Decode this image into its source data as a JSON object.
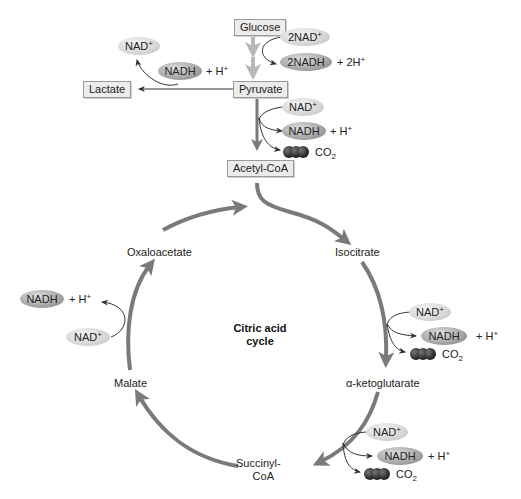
{
  "glycolysis": {
    "glucose": "Glucose",
    "pyruvate": "Pyruvate",
    "lactate": "Lactate",
    "acetyl_coa": "Acetyl-CoA",
    "nad_2": "2NAD",
    "nadh_2": "2NADH",
    "h_2": "+ 2H",
    "plus": "+"
  },
  "lactate_branch": {
    "nad": "NAD",
    "nadh": "NADH",
    "h": "+ H",
    "plus": "+"
  },
  "pyruvate_branch": {
    "nad": "NAD",
    "nadh": "NADH",
    "h": "+ H",
    "co2": "CO",
    "co2_sub": "2",
    "plus": "+"
  },
  "cycle": {
    "label_line1": "Citric acid",
    "label_line2": "cycle",
    "intermediates": {
      "oxaloacetate": "Oxaloacetate",
      "isocitrate": "Isocitrate",
      "alpha_ketoglutarate": "α-ketoglutarate",
      "succinyl_coa_line1": "Succinyl-",
      "succinyl_coa_line2": "CoA",
      "malate": "Malate"
    }
  },
  "isocitrate_branch": {
    "nad": "NAD",
    "nadh": "NADH",
    "h": "+ H",
    "co2": "CO",
    "co2_sub": "2",
    "plus": "+"
  },
  "ketoglutarate_branch": {
    "nad": "NAD",
    "nadh": "NADH",
    "h": "+ H",
    "co2": "CO",
    "co2_sub": "2",
    "plus": "+"
  },
  "malate_branch": {
    "nad": "NAD",
    "nadh": "NADH",
    "h": "+ H",
    "plus": "+"
  },
  "colors": {
    "main_arrow": "#7a7a7a",
    "glycolysis_arrow": "#b8b8b8",
    "box_fill": "#ececec",
    "box_border": "#9a9a9a"
  }
}
